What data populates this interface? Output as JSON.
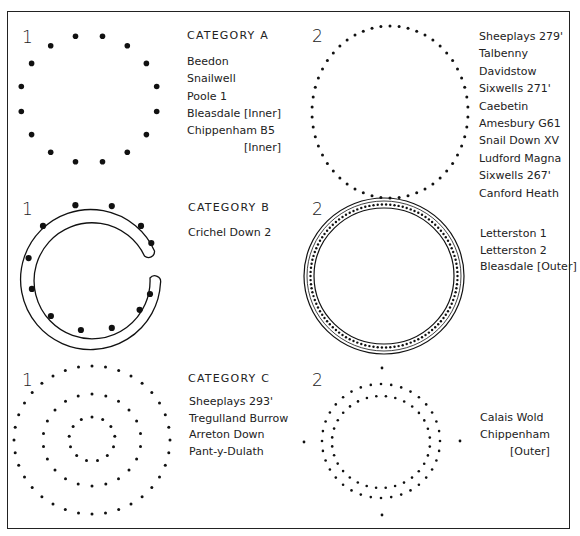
{
  "colors": {
    "ink": "#1a1a1a",
    "background": "#ffffff"
  },
  "panels": [
    {
      "id": "A1",
      "number": "1",
      "category": "CATEGORY A",
      "shape": "ring of large spaced dots (16 dots)",
      "sites": [
        "Beedon",
        "Snailwell",
        "Poole 1",
        "Bleasdale [Inner]",
        "Chippenham B5",
        "[Inner]"
      ]
    },
    {
      "id": "A2",
      "number": "2",
      "category": "",
      "shape": "ring of many small close-set dots",
      "sites": [
        "Sheeplays 279'",
        "Talbenny",
        "Davidstow",
        "Sixwells 271'",
        "Caebetin",
        "Amesbury G61",
        "Snail Down XV",
        "Ludford Magna",
        "Sixwells 267'",
        "Canford Heath"
      ]
    },
    {
      "id": "B1",
      "number": "1",
      "category": "CATEGORY B",
      "shape": "penannular trench with large dots (open to east)",
      "sites": [
        "Crichel Down 2"
      ]
    },
    {
      "id": "B2",
      "number": "2",
      "category": "",
      "shape": "circular trench with dense ring of small dots",
      "sites": [
        "Letterston 1",
        "Letterston 2",
        "Bleasdale [Outer]"
      ]
    },
    {
      "id": "C1",
      "number": "1",
      "category": "CATEGORY C",
      "shape": "three concentric dotted rings",
      "sites": [
        "Sheeplays 293'",
        "Tregulland Burrow",
        "Arreton Down",
        "Pant-y-Dulath"
      ]
    },
    {
      "id": "C2",
      "number": "2",
      "category": "",
      "shape": "double/irregular dotted ring with four cardinal outliers",
      "sites": [
        "Calais Wold",
        "Chippenham",
        "[Outer]"
      ]
    }
  ]
}
